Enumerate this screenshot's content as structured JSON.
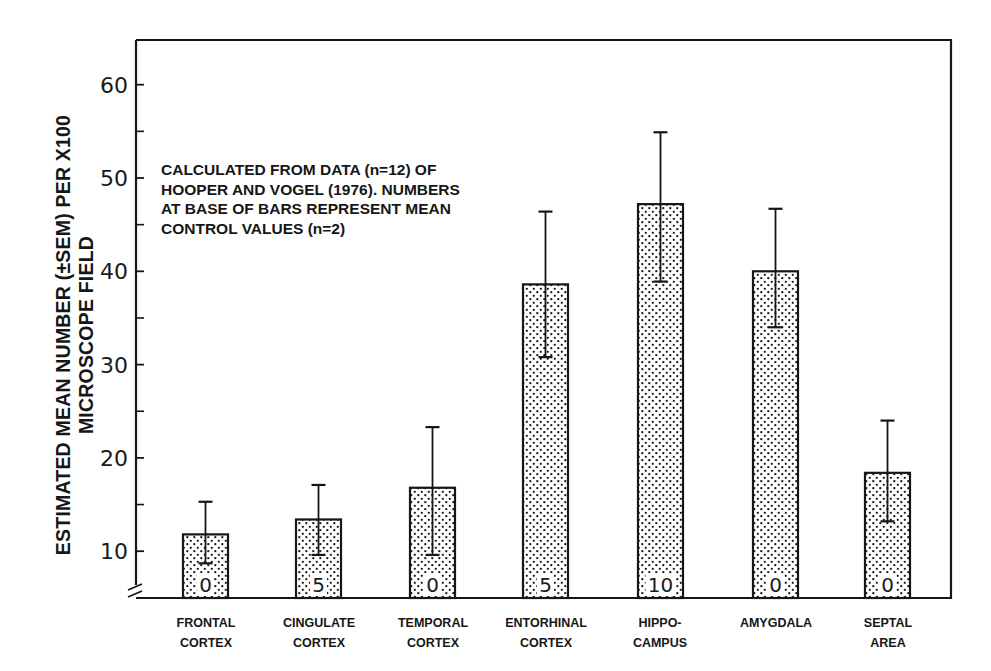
{
  "chart_data": {
    "type": "bar",
    "title": "",
    "xlabel": "",
    "ylabel_line1": "ESTIMATED MEAN NUMBER (±SEM) PER X100",
    "ylabel_line2": "MICROSCOPE FIELD",
    "ylim": [
      5,
      65
    ],
    "yticks": [
      10,
      20,
      30,
      40,
      50,
      60
    ],
    "yticks_minor": [
      15,
      25,
      35,
      45,
      55
    ],
    "grid": false,
    "axis_break": true,
    "categories": [
      [
        "FRONTAL",
        "CORTEX"
      ],
      [
        "CINGULATE",
        "CORTEX"
      ],
      [
        "TEMPORAL",
        "CORTEX"
      ],
      [
        "ENTORHINAL",
        "CORTEX"
      ],
      [
        "HIPPO-",
        "CAMPUS"
      ],
      [
        "AMYGDALA"
      ],
      [
        "SEPTAL",
        "AREA"
      ]
    ],
    "values": [
      11.8,
      13.4,
      16.8,
      38.6,
      47.2,
      40.0,
      18.4
    ],
    "error_upper": [
      15.3,
      17.1,
      23.3,
      46.4,
      54.9,
      46.7,
      24.0
    ],
    "error_lower": [
      8.7,
      9.6,
      9.6,
      30.8,
      38.9,
      34.0,
      13.2
    ],
    "base_labels": [
      "0",
      "5",
      "0",
      "5",
      "10",
      "0",
      "0"
    ],
    "annotation": [
      "CALCULATED FROM DATA (n=12) OF",
      "HOOPER AND VOGEL (1976). NUMBERS",
      "AT BASE OF BARS REPRESENT MEAN",
      "CONTROL VALUES (n=2)"
    ],
    "bar_fill": "stippled",
    "colors": {
      "ink": "#161616",
      "background": "#ffffff"
    }
  }
}
